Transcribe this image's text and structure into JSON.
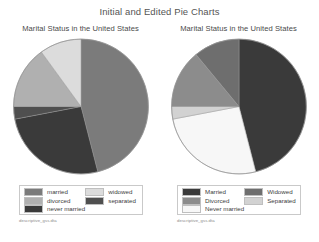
{
  "header": {
    "title": "Initial and Edited Pie Charts"
  },
  "panels": [
    {
      "id": "initial",
      "subtitle": "Marital Status in the United States",
      "source": "descriptive_gss.dta",
      "legend_col1": [
        {
          "label": "married",
          "color": "#7b7b7b"
        },
        {
          "label": "divorced",
          "color": "#b0b0b0"
        },
        {
          "label": "never married",
          "color": "#3a3a3a"
        }
      ],
      "legend_col2": [
        {
          "label": "widowed",
          "color": "#dcdcdc"
        },
        {
          "label": "separated",
          "color": "#4f4f4f"
        }
      ]
    },
    {
      "id": "edited",
      "subtitle": "Marital Status in the United States",
      "source": "descriptive_gss.dta",
      "legend_col1": [
        {
          "label": "Married",
          "color": "#3a3a3a"
        },
        {
          "label": "Divorced",
          "color": "#8c8c8c"
        },
        {
          "label": "Never married",
          "color": "#f7f7f7"
        }
      ],
      "legend_col2": [
        {
          "label": "Widowed",
          "color": "#6e6e6e"
        },
        {
          "label": "Separated",
          "color": "#d2d2d2"
        }
      ]
    }
  ],
  "chart_data": [
    {
      "type": "pie",
      "title": "Marital Status in the United States",
      "id": "initial-pie",
      "categories": [
        "married",
        "never married",
        "separated",
        "divorced",
        "widowed"
      ],
      "values": [
        46,
        26,
        3,
        15,
        10
      ],
      "unit": "percent",
      "labels_shown": false,
      "legend": {
        "position": "bottom",
        "entries": [
          "married",
          "divorced",
          "never married",
          "widowed",
          "separated"
        ]
      },
      "slices": [
        {
          "name": "married",
          "percent": 46,
          "color": "#7b7b7b"
        },
        {
          "name": "never married",
          "percent": 26,
          "color": "#3a3a3a"
        },
        {
          "name": "separated",
          "percent": 3,
          "color": "#4f4f4f"
        },
        {
          "name": "divorced",
          "percent": 15,
          "color": "#b0b0b0"
        },
        {
          "name": "widowed",
          "percent": 10,
          "color": "#dcdcdc"
        }
      ]
    },
    {
      "type": "pie",
      "title": "Marital Status in the United States",
      "id": "edited-pie",
      "categories": [
        "Married",
        "Never married",
        "Widowed",
        "Separated",
        "Divorced"
      ],
      "values": [
        46,
        26,
        3,
        2,
        23
      ],
      "unit": "percent",
      "labels_shown": false,
      "legend": {
        "position": "bottom",
        "entries": [
          "Married",
          "Divorced",
          "Never married",
          "Widowed",
          "Separated"
        ]
      },
      "slices": [
        {
          "name": "Married",
          "percent": 46,
          "color": "#3a3a3a"
        },
        {
          "name": "Never married",
          "percent": 26,
          "color": "#f7f7f7"
        },
        {
          "name": "Separated",
          "percent": 3,
          "color": "#d2d2d2"
        },
        {
          "name": "Divorced",
          "percent": 14,
          "color": "#8c8c8c"
        },
        {
          "name": "Widowed",
          "percent": 11,
          "color": "#6e6e6e"
        }
      ]
    }
  ]
}
